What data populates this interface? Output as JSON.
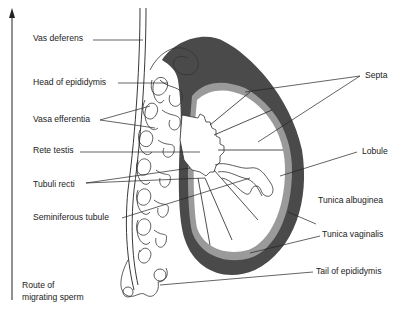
{
  "diagram": {
    "colors": {
      "tunica_vaginalis": "#4a4a4a",
      "tunica_albuginea": "#9a9a9a",
      "line": "#222222",
      "background": "#ffffff"
    },
    "labels_left": [
      {
        "id": "vas-deferens",
        "text": "Vas deferens"
      },
      {
        "id": "head-of-epididymis",
        "text": "Head of epididymis"
      },
      {
        "id": "vasa-efferentia",
        "text": "Vasa efferentia"
      },
      {
        "id": "rete-testis",
        "text": "Rete testis"
      },
      {
        "id": "tubuli-recti",
        "text": "Tubuli recti"
      },
      {
        "id": "seminiferous-tubule",
        "text": "Seminiferous tubule"
      }
    ],
    "labels_right": [
      {
        "id": "septa",
        "text": "Septa"
      },
      {
        "id": "lobule",
        "text": "Lobule"
      },
      {
        "id": "tunica-albuginea",
        "text": "Tunica albuginea"
      },
      {
        "id": "tunica-vaginalis",
        "text": "Tunica vaginalis"
      },
      {
        "id": "tail-of-epididymis",
        "text": "Tail of epididymis"
      }
    ],
    "arrow_caption": {
      "line1": "Route of",
      "line2": "migrating sperm"
    }
  }
}
